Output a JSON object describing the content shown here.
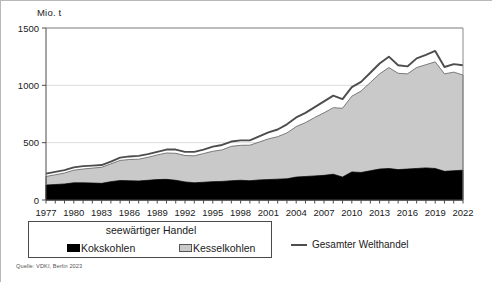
{
  "chart_data": {
    "type": "area",
    "title": "",
    "subtitle": "",
    "xlabel": "",
    "ylabel": "Mio. t",
    "unit_label": "Mio. t",
    "ylim": [
      0,
      1500
    ],
    "yticks": [
      0,
      500,
      1000,
      1500
    ],
    "ytick_labels": [
      "0",
      "500",
      "1000",
      "1500"
    ],
    "grid": true,
    "legend_position": "bottom",
    "stacked": true,
    "x": [
      1977,
      1978,
      1979,
      1980,
      1981,
      1982,
      1983,
      1984,
      1985,
      1986,
      1987,
      1988,
      1989,
      1990,
      1991,
      1992,
      1993,
      1994,
      1995,
      1996,
      1997,
      1998,
      1999,
      2000,
      2001,
      2002,
      2003,
      2004,
      2005,
      2006,
      2007,
      2008,
      2009,
      2010,
      2011,
      2012,
      2013,
      2014,
      2015,
      2016,
      2017,
      2018,
      2019,
      2020,
      2021,
      2022
    ],
    "xtick_labels": [
      "1977",
      "1980",
      "1983",
      "1986",
      "1989",
      "1992",
      "1995",
      "1998",
      "2001",
      "2004",
      "2007",
      "2010",
      "2013",
      "2016",
      "2019",
      "2022"
    ],
    "series": [
      {
        "name": "Kokskohlen",
        "color": "#000000",
        "values": [
          130,
          135,
          140,
          150,
          150,
          148,
          145,
          160,
          170,
          168,
          166,
          172,
          178,
          180,
          172,
          158,
          150,
          155,
          160,
          162,
          168,
          172,
          168,
          175,
          178,
          182,
          185,
          200,
          205,
          210,
          215,
          225,
          200,
          245,
          240,
          255,
          270,
          275,
          265,
          270,
          275,
          280,
          275,
          250,
          255,
          260
        ]
      },
      {
        "name": "Kesselkohlen",
        "color": "#c9c9c9",
        "values": [
          75,
          85,
          95,
          110,
          120,
          130,
          140,
          155,
          175,
          185,
          190,
          200,
          215,
          230,
          235,
          230,
          235,
          250,
          265,
          275,
          300,
          305,
          310,
          330,
          355,
          370,
          400,
          440,
          470,
          510,
          545,
          580,
          600,
          660,
          710,
          770,
          830,
          880,
          840,
          830,
          880,
          900,
          930,
          850,
          860,
          830
        ]
      }
    ],
    "line_series": {
      "name": "Gesamter Welthandel",
      "color": "#4d4d4d",
      "values": [
        230,
        245,
        260,
        285,
        295,
        300,
        305,
        335,
        370,
        380,
        385,
        400,
        420,
        440,
        440,
        420,
        420,
        440,
        465,
        480,
        510,
        520,
        520,
        555,
        590,
        615,
        660,
        720,
        760,
        810,
        860,
        910,
        880,
        985,
        1030,
        1110,
        1190,
        1250,
        1175,
        1165,
        1235,
        1265,
        1300,
        1160,
        1185,
        1175
      ]
    },
    "legend": {
      "box_title": "seewärtiger Handel",
      "items": [
        {
          "label": "Kokskohlen",
          "marker": "filled-square-black",
          "color": "#000000"
        },
        {
          "label": "Kesselkohlen",
          "marker": "filled-square-gray",
          "color": "#c9c9c9"
        }
      ],
      "line_item": {
        "label": "Gesamter Welthandel",
        "marker": "line",
        "color": "#4d4d4d"
      }
    },
    "source": "Quelle: VDKI, Berlin 2023"
  }
}
